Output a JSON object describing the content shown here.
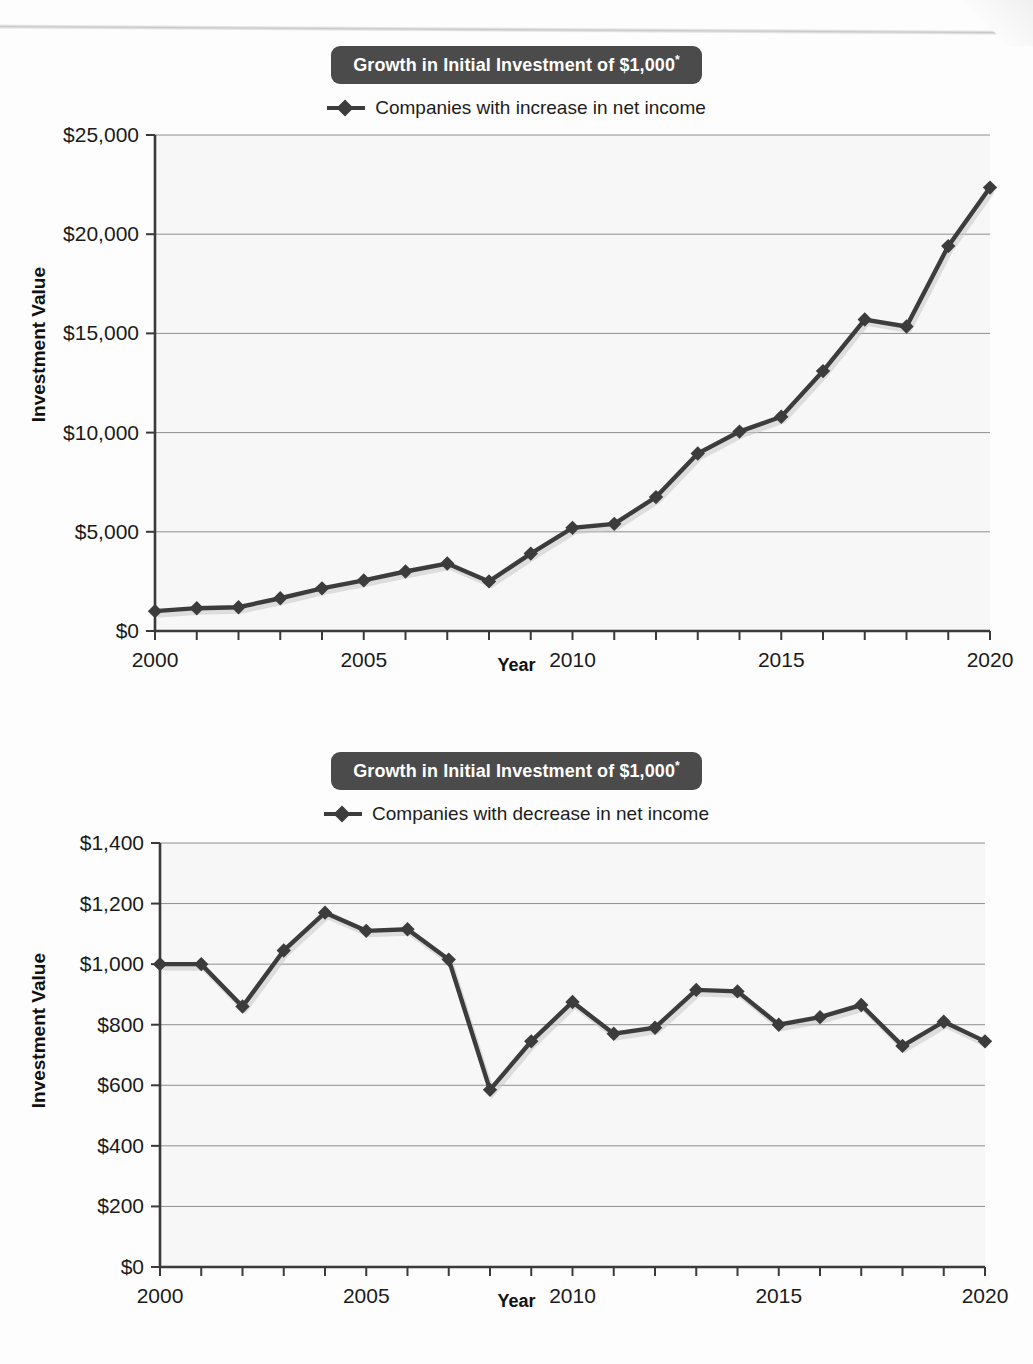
{
  "page": {
    "background_color": "#fdfdfd",
    "accent_color": "#4b4b4b",
    "series_color": "#3c3c3c"
  },
  "figures": [
    {
      "id": "figure-1",
      "title": "Growth in Initial Investment of $1,000",
      "title_asterisk": "*",
      "legend_label": "Companies with increase in net income",
      "legend_marker": "diamond-line-marker"
    },
    {
      "id": "figure-2",
      "title": "Growth in Initial Investment of $1,000",
      "title_asterisk": "*",
      "legend_label": "Companies with decrease in net income",
      "legend_marker": "diamond-line-marker"
    }
  ],
  "chart_data": [
    {
      "type": "line",
      "title": "Growth in Initial Investment of $1,000*",
      "xlabel": "Year",
      "ylabel": "Investment Value",
      "legend": [
        "Companies with increase in net income"
      ],
      "legend_position": "top-center",
      "grid": true,
      "xlim": [
        2000,
        2020
      ],
      "ylim": [
        0,
        25000
      ],
      "ytick_labels": [
        "$0",
        "$5,000",
        "$10,000",
        "$15,000",
        "$20,000",
        "$25,000"
      ],
      "ytick_values": [
        0,
        5000,
        10000,
        15000,
        20000,
        25000
      ],
      "xtick_labels": [
        "2000",
        "2005",
        "2010",
        "2015",
        "2020"
      ],
      "xtick_values": [
        2000,
        2005,
        2010,
        2015,
        2020
      ],
      "x": [
        2000,
        2001,
        2002,
        2003,
        2004,
        2005,
        2006,
        2007,
        2008,
        2009,
        2010,
        2011,
        2012,
        2013,
        2014,
        2015,
        2016,
        2017,
        2018,
        2019,
        2020
      ],
      "series": [
        {
          "name": "Companies with increase in net income",
          "values": [
            1000,
            1150,
            1200,
            1650,
            2150,
            2550,
            3000,
            3400,
            2500,
            3900,
            5200,
            5400,
            6750,
            8950,
            10050,
            10800,
            13100,
            15700,
            15350,
            19400,
            22350
          ]
        }
      ]
    },
    {
      "type": "line",
      "title": "Growth in Initial Investment of $1,000*",
      "xlabel": "Year",
      "ylabel": "Investment Value",
      "legend": [
        "Companies with decrease in net income"
      ],
      "legend_position": "top-center",
      "grid": true,
      "xlim": [
        2000,
        2020
      ],
      "ylim": [
        0,
        1400
      ],
      "ytick_labels": [
        "$0",
        "$200",
        "$400",
        "$600",
        "$800",
        "$1,000",
        "$1,200",
        "$1,400"
      ],
      "ytick_values": [
        0,
        200,
        400,
        600,
        800,
        1000,
        1200,
        1400
      ],
      "xtick_labels": [
        "2000",
        "2005",
        "2010",
        "2015",
        "2020"
      ],
      "xtick_values": [
        2000,
        2005,
        2010,
        2015,
        2020
      ],
      "x": [
        2000,
        2001,
        2002,
        2003,
        2004,
        2005,
        2006,
        2007,
        2008,
        2009,
        2010,
        2011,
        2012,
        2013,
        2014,
        2015,
        2016,
        2017,
        2018,
        2019,
        2020
      ],
      "series": [
        {
          "name": "Companies with decrease in net income",
          "values": [
            1000,
            1000,
            860,
            1045,
            1170,
            1110,
            1115,
            1015,
            585,
            745,
            875,
            770,
            790,
            915,
            910,
            800,
            825,
            865,
            730,
            810,
            745
          ]
        }
      ]
    }
  ]
}
